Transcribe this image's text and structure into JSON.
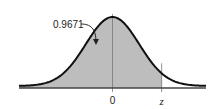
{
  "chart_data": {
    "type": "area",
    "title": "",
    "distribution": "standard normal",
    "mean": 0,
    "sd": 1,
    "shaded_region": {
      "from": "-inf",
      "to": "z",
      "area": 0.9671
    },
    "annotation": "0.9671",
    "tick_labels": [
      "0",
      "z"
    ],
    "z_value": 1.84,
    "xlim": [
      -3.5,
      3.5
    ],
    "xlabel": "",
    "ylabel": "",
    "colors": {
      "fill": "#bdbdbd",
      "curve": "#111111",
      "axis": "#444444"
    }
  }
}
